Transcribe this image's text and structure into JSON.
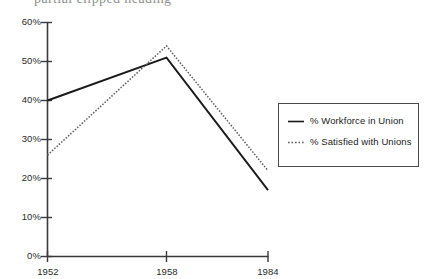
{
  "top_fragment": {
    "text": "partial clipped heading"
  },
  "chart_data": {
    "type": "line",
    "title": "",
    "xlabel": "",
    "ylabel": "",
    "categories": [
      "1952",
      "1958",
      "1984"
    ],
    "x_tick_labels": [
      "1952",
      "1958",
      "1984"
    ],
    "y_tick_labels": [
      "0%",
      "10%",
      "20%",
      "30%",
      "40%",
      "50%",
      "60%"
    ],
    "y_tick_values": [
      0,
      10,
      20,
      30,
      40,
      50,
      60
    ],
    "ylim": [
      0,
      60
    ],
    "grid": false,
    "legend_position": "right",
    "series": [
      {
        "name": "% Workforce in Union",
        "style": "solid",
        "color": "#1a1a1a",
        "values": [
          40,
          51,
          17
        ]
      },
      {
        "name": "% Satisfied with Unions",
        "style": "dotted",
        "color": "#5a5a5a",
        "values": [
          26,
          54,
          22
        ]
      }
    ]
  },
  "legend": {
    "entries": [
      {
        "label": "% Workforce in Union",
        "marker": "solid-line-marker"
      },
      {
        "label": "% Satisfied with Unions",
        "marker": "dotted-line-marker"
      }
    ]
  }
}
